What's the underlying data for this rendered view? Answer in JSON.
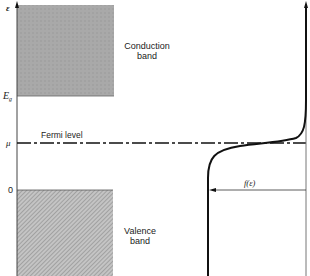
{
  "diagram": {
    "title": "",
    "type": "band-diagram-with-fermi-dirac",
    "axis_labels": {
      "energy": "ε",
      "gap": "E",
      "gap_sub": "g",
      "chemical_potential": "μ",
      "zero": "0"
    },
    "bands": {
      "conduction": {
        "line1": "Conduction",
        "line2": "band"
      },
      "valence": {
        "line1": "Valence",
        "line2": "band"
      }
    },
    "fermi_level_label": "Fermi level",
    "distribution_label": "f(ε)",
    "colors": {
      "conduction_fill": "#a9a9a9",
      "valence_fill": "#b5b5b5",
      "ink": "#111111"
    }
  }
}
